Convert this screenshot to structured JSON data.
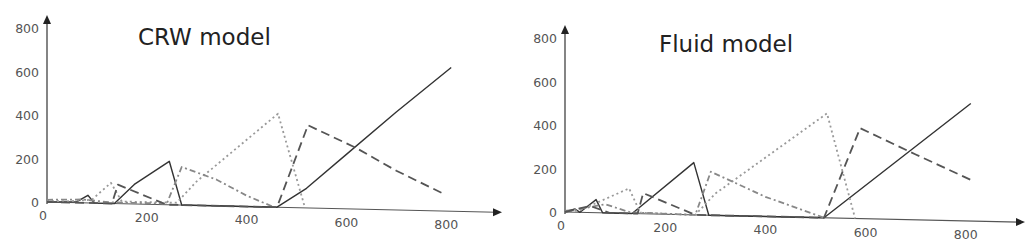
{
  "chart_data": [
    {
      "type": "line",
      "title": "CRW model",
      "xlabel": "",
      "ylabel": "",
      "xlim": [
        0,
        900
      ],
      "ylim": [
        0,
        800
      ],
      "xticks": [
        0,
        200,
        400,
        600,
        800
      ],
      "yticks": [
        0,
        200,
        400,
        600,
        800
      ],
      "grid": false,
      "legend": null,
      "series": [
        {
          "name": "solid",
          "style": "solid",
          "color": "#333333",
          "points": [
            [
              0,
              0
            ],
            [
              60,
              5
            ],
            [
              82,
              35
            ],
            [
              95,
              0
            ],
            [
              135,
              0
            ],
            [
              175,
              90
            ],
            [
              245,
              200
            ],
            [
              270,
              0
            ],
            [
              461,
              0
            ],
            [
              520,
              90
            ],
            [
              600,
              250
            ],
            [
              700,
              450
            ],
            [
              810,
              660
            ]
          ]
        },
        {
          "name": "dotted",
          "style": "dotted",
          "color": "#999999",
          "points": [
            [
              0,
              5
            ],
            [
              40,
              5
            ],
            [
              90,
              15
            ],
            [
              128,
              95
            ],
            [
              150,
              10
            ],
            [
              260,
              10
            ],
            [
              300,
              110
            ],
            [
              463,
              430
            ],
            [
              517,
              0
            ]
          ]
        },
        {
          "name": "dash-dot",
          "style": "dashdot",
          "color": "#888888",
          "points": [
            [
              0,
              10
            ],
            [
              70,
              15
            ],
            [
              130,
              5
            ],
            [
              240,
              5
            ],
            [
              270,
              175
            ],
            [
              340,
              120
            ],
            [
              400,
              50
            ],
            [
              455,
              0
            ]
          ]
        },
        {
          "name": "long-dashed",
          "style": "dashed",
          "color": "#555555",
          "points": [
            [
              0,
              0
            ],
            [
              130,
              0
            ],
            [
              142,
              87
            ],
            [
              240,
              0
            ],
            [
              461,
              0
            ],
            [
              523,
              380
            ],
            [
              620,
              280
            ],
            [
              700,
              180
            ],
            [
              798,
              75
            ]
          ]
        }
      ]
    },
    {
      "type": "line",
      "title": "Fluid model",
      "xlabel": "",
      "ylabel": "",
      "xlim": [
        0,
        900
      ],
      "ylim": [
        0,
        800
      ],
      "xticks": [
        0,
        200,
        400,
        600,
        800
      ],
      "yticks": [
        0,
        200,
        400,
        600,
        800
      ],
      "grid": false,
      "legend": null,
      "series": [
        {
          "name": "solid",
          "style": "solid",
          "color": "#333333",
          "points": [
            [
              0,
              0
            ],
            [
              20,
              15
            ],
            [
              30,
              0
            ],
            [
              62,
              60
            ],
            [
              75,
              0
            ],
            [
              134,
              0
            ],
            [
              257,
              240
            ],
            [
              287,
              0
            ],
            [
              517,
              0
            ],
            [
              810,
              540
            ]
          ]
        },
        {
          "name": "dotted",
          "style": "dotted",
          "color": "#999999",
          "points": [
            [
              0,
              0
            ],
            [
              30,
              10
            ],
            [
              128,
              115
            ],
            [
              150,
              5
            ],
            [
              260,
              0
            ],
            [
              300,
              100
            ],
            [
              523,
              480
            ],
            [
              579,
              0
            ]
          ]
        },
        {
          "name": "dash-dot",
          "style": "dashdot",
          "color": "#888888",
          "points": [
            [
              0,
              5
            ],
            [
              40,
              20
            ],
            [
              80,
              40
            ],
            [
              130,
              5
            ],
            [
              260,
              0
            ],
            [
              291,
              200
            ],
            [
              400,
              90
            ],
            [
              517,
              0
            ]
          ]
        },
        {
          "name": "long-dashed",
          "style": "dashed",
          "color": "#555555",
          "points": [
            [
              0,
              0
            ],
            [
              50,
              30
            ],
            [
              90,
              0
            ],
            [
              145,
              0
            ],
            [
              156,
              95
            ],
            [
              260,
              0
            ],
            [
              517,
              0
            ],
            [
              589,
              415
            ],
            [
              700,
              300
            ],
            [
              809,
              190
            ]
          ]
        }
      ]
    }
  ],
  "panels": [
    {
      "title": "CRW model",
      "x_ticks": [
        "0",
        "200",
        "400",
        "600",
        "800"
      ],
      "y_ticks": [
        "0",
        "200",
        "400",
        "600",
        "800"
      ]
    },
    {
      "title": "Fluid model",
      "x_ticks": [
        "0",
        "200",
        "400",
        "600",
        "800"
      ],
      "y_ticks": [
        "0",
        "200",
        "400",
        "600",
        "800"
      ]
    }
  ]
}
